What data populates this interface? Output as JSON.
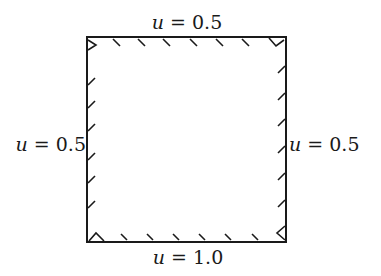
{
  "diagram": {
    "type": "boundary-value-domain",
    "shape": "square",
    "boundaries": {
      "top": {
        "variable": "u",
        "operator": "=",
        "value": "0.5"
      },
      "bottom": {
        "variable": "u",
        "operator": "=",
        "value": "1.0"
      },
      "left": {
        "variable": "u",
        "operator": "=",
        "value": "0.5"
      },
      "right": {
        "variable": "u",
        "operator": "=",
        "value": "0.5"
      }
    },
    "hatch_marks": {
      "top": 7,
      "bottom": 7,
      "left": 7,
      "right": 7
    },
    "colors": {
      "stroke": "#1a1a1a",
      "background": "#ffffff"
    }
  }
}
